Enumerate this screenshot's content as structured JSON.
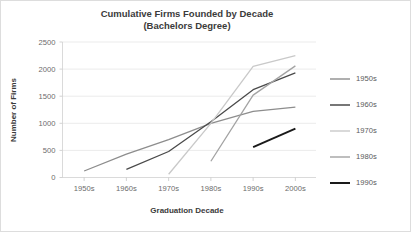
{
  "chart_data": {
    "type": "line",
    "title": "Cumulative Firms Founded by Decade",
    "subtitle": "(Bachelors Degree)",
    "xlabel": "Graduation Decade",
    "ylabel": "Number of Firms",
    "categories": [
      "1950s",
      "1960s",
      "1970s",
      "1980s",
      "1990s",
      "2000s"
    ],
    "ylim": [
      0,
      2500
    ],
    "yticks": [
      0,
      500,
      1000,
      1500,
      2000,
      2500
    ],
    "ytick_labels": [
      "0",
      "500",
      "1000",
      "1500",
      "2000",
      "2500"
    ],
    "grid": true,
    "legend_position": "right",
    "series": [
      {
        "name": "1950s",
        "color": "#8d8d8d",
        "width": 1.3,
        "values": [
          120,
          430,
          700,
          1000,
          1220,
          1300
        ]
      },
      {
        "name": "1960s",
        "color": "#4a4a4a",
        "width": 1.3,
        "values": [
          null,
          150,
          480,
          1030,
          1620,
          1930
        ]
      },
      {
        "name": "1970s",
        "color": "#c9c9c9",
        "width": 1.3,
        "values": [
          null,
          null,
          60,
          1000,
          2050,
          2250
        ]
      },
      {
        "name": "1980s",
        "color": "#a3a3a3",
        "width": 1.3,
        "values": [
          null,
          null,
          null,
          300,
          1520,
          2060
        ]
      },
      {
        "name": "1990s",
        "color": "#1a1a1a",
        "width": 1.9,
        "values": [
          null,
          null,
          null,
          null,
          560,
          900
        ]
      }
    ]
  },
  "legend": {
    "entries": [
      {
        "label": "1950s",
        "color": "#8d8d8d",
        "width": 1.4
      },
      {
        "label": "1960s",
        "color": "#4a4a4a",
        "width": 1.5
      },
      {
        "label": "1970s",
        "color": "#c9c9c9",
        "width": 1.4
      },
      {
        "label": "1980s",
        "color": "#a3a3a3",
        "width": 1.4
      },
      {
        "label": "1990s",
        "color": "#1a1a1a",
        "width": 2.0
      }
    ]
  },
  "theme": {
    "background": "#ffffff",
    "grid_color": "#e2e2e2",
    "axis_color": "#d0d0d0",
    "text_color": "#3b3b3b",
    "tick_text_color": "#6b6b6b"
  }
}
